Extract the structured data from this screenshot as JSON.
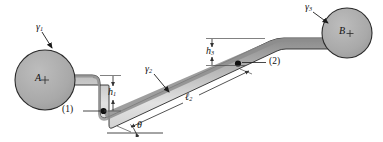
{
  "figure": {
    "background": "#ffffff",
    "tank_fill": "#a8a8a8",
    "tank_stroke": "#2a2a2a",
    "pipe_fill_dark": "#8f8f8f",
    "pipe_fill_light": "#e3e3e3",
    "pipe_stroke": "#2a2a2a",
    "line_color": "#1a1a1a",
    "dim_color": "#4a4a4a"
  },
  "labels": {
    "tank_a": "A",
    "tank_b": "B",
    "gamma1": "γ",
    "gamma1_sub": "1",
    "gamma2": "γ",
    "gamma2_sub": "2",
    "gamma3": "γ",
    "gamma3_sub": "3",
    "h1": "h",
    "h1_sub": "1",
    "h3": "h",
    "h3_sub": "3",
    "l2": "ℓ",
    "l2_sub": "2",
    "theta": "θ",
    "point1": "(1)",
    "point2": "(2)"
  },
  "annotations": {
    "gamma1_desc": "specific weight of fluid in tank A",
    "gamma2_desc": "specific weight of fluid in inclined pipe",
    "gamma3_desc": "specific weight of fluid in tank B",
    "h1_desc": "vertical drop from tank A outlet to point (1)",
    "h3_desc": "vertical rise from point (2) to tank B level",
    "l2_desc": "length of inclined pipe section between (1) and (2)",
    "theta_desc": "inclination angle of pipe from horizontal"
  }
}
